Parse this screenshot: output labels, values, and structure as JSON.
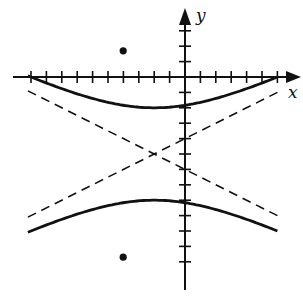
{
  "diagram": {
    "type": "hyperbola-graph",
    "axes": {
      "x_label": "x",
      "y_label": "y",
      "unit_px": 15.4,
      "origin_px": [
        185,
        77
      ],
      "x_ticks": [
        -10,
        -9,
        -8,
        -7,
        -6,
        -5,
        -4,
        -3,
        -2,
        -1,
        1,
        2,
        3,
        4,
        5,
        6
      ],
      "y_ticks": [
        3,
        2,
        1,
        -1,
        -2,
        -3,
        -4,
        -5,
        -6,
        -7,
        -8,
        -9,
        -10,
        -11,
        -12
      ]
    },
    "hyperbola": {
      "equation": "(y+5)^2/9 - (x+2)^2/36 = 1",
      "center": [
        -2,
        -5
      ],
      "a": 3,
      "b": 6,
      "vertices": [
        [
          -2,
          -2
        ],
        [
          -2,
          -8
        ]
      ],
      "foci": [
        [
          -2,
          1.7
        ],
        [
          -2,
          -11.7
        ]
      ],
      "asymptotes": [
        "y + 5 = 0.5(x + 2)",
        "y + 5 = -0.5(x + 2)"
      ]
    },
    "points": [
      {
        "name": "focus-upper",
        "coords": [
          -2,
          1.7
        ]
      },
      {
        "name": "focus-lower",
        "coords": [
          -2,
          -11.7
        ]
      }
    ],
    "colors": {
      "stroke": "#111111",
      "background": "#ffffff"
    }
  }
}
